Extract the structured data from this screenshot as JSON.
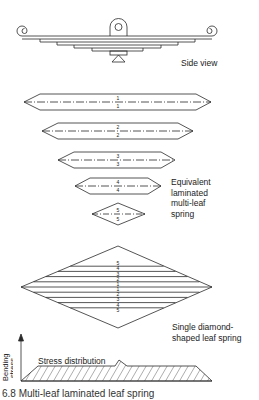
{
  "figure": {
    "title": "Multi-leaf laminated leaf spring",
    "caption": "6.8 Multi-leaf laminated leaf spring"
  },
  "labels": {
    "side_view": "Side view",
    "equivalent_line1": "Equivalent",
    "equivalent_line2": "laminated",
    "equivalent_line3": "multi-leaf",
    "equivalent_line4": "spring",
    "diamond_line1": "Single diamond-",
    "diamond_line2": "shaped leaf spring",
    "stress_distribution": "Stress distribution",
    "y_axis_line1": "Bending",
    "y_axis_line2": "stress"
  },
  "leaves": [
    {
      "top": "1",
      "bottom": "1"
    },
    {
      "top": "2",
      "bottom": "2"
    },
    {
      "top": "3",
      "bottom": "3"
    },
    {
      "top": "4",
      "bottom": "4"
    },
    {
      "top": "5",
      "bottom": "5"
    }
  ],
  "diamond_strips": [
    "5",
    "4",
    "3",
    "2",
    "1",
    "1",
    "2",
    "3",
    "4",
    "5"
  ],
  "colors": {
    "line": "#2a2a2a",
    "background": "#ffffff"
  }
}
